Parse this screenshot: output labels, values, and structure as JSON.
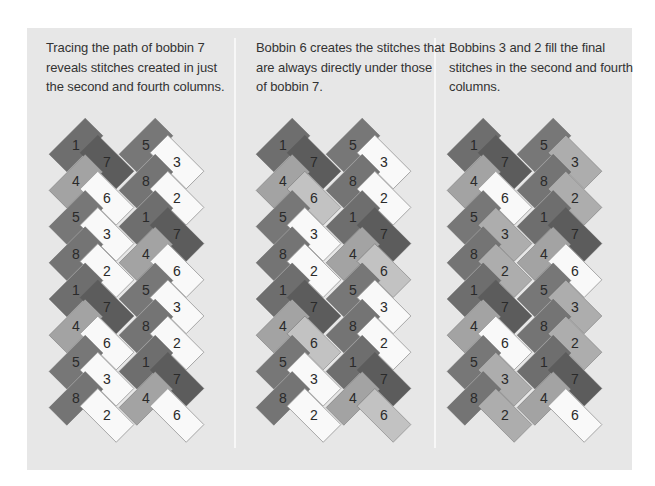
{
  "panels": [
    {
      "caption": "Tracing the path of bobbin 7 reveals stitches created in just the second and fourth columns.",
      "x_offset": 0,
      "colors": {
        "1": "#6e6e6e",
        "7": "#5c5c5c",
        "4": "#a3a3a3",
        "5": "#777777",
        "8": "#747474",
        "6": "#f9f9f9",
        "3": "#f9f9f9",
        "2": "#f9f9f9"
      }
    },
    {
      "caption": "Bobbin 6 creates the stitches that are always directly under those of bobbin 7.",
      "x_offset": 207,
      "colors": {
        "1": "#6e6e6e",
        "7": "#5c5c5c",
        "4": "#a3a3a3",
        "5": "#777777",
        "8": "#747474",
        "6": "#c2c2c2",
        "3": "#f9f9f9",
        "2": "#f9f9f9"
      }
    },
    {
      "caption": "Bobbins 3 and 2 fill the final stitches in the second and fourth columns.",
      "x_offset": 398,
      "colors": {
        "1": "#6e6e6e",
        "7": "#5c5c5c",
        "4": "#a3a3a3",
        "5": "#777777",
        "8": "#747474",
        "6": "#f9f9f9",
        "3": "#adadad",
        "2": "#adadad"
      }
    }
  ],
  "braid": {
    "columns": [
      {
        "x": 76,
        "y0": 145,
        "tilt": "up-right",
        "labels": [
          "1",
          "4",
          "5",
          "8",
          "1",
          "4",
          "5",
          "8"
        ]
      },
      {
        "x": 107,
        "y0": 162,
        "tilt": "down-right",
        "labels": [
          "7",
          "6",
          "3",
          "2",
          "7",
          "6",
          "3",
          "2"
        ]
      },
      {
        "x": 146,
        "y0": 145,
        "tilt": "up-right",
        "labels": [
          "5",
          "8",
          "1",
          "4",
          "5",
          "8",
          "1",
          "4"
        ]
      },
      {
        "x": 177,
        "y0": 162,
        "tilt": "down-right",
        "labels": [
          "3",
          "2",
          "7",
          "6",
          "3",
          "2",
          "7",
          "6"
        ]
      }
    ],
    "row_step": 36.2,
    "tile_length": 51,
    "tile_width": 25
  }
}
